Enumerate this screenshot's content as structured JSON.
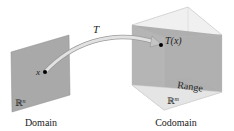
{
  "figure": {
    "domain": {
      "caption": "Domain",
      "space_label": "ℝ",
      "space_exp": "n",
      "point_label": "x"
    },
    "codomain": {
      "caption": "Codomain",
      "space_label": "ℝ",
      "space_exp": "m",
      "range_label": "Range",
      "point_label": "T(x)"
    },
    "mapping_label": "T",
    "colors": {
      "plane": "#a9a9a9",
      "cube_face_light": "#e6e6e6",
      "range_plane": "#a3a3a3",
      "arrow": "#c8c8c8"
    }
  }
}
